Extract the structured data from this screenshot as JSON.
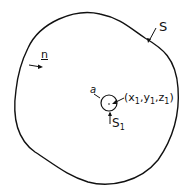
{
  "diagram": {
    "surface_label": "S",
    "normal_label": "n",
    "small_sphere_label": "S",
    "small_sphere_sub": "1",
    "radius_label": "a",
    "point_label": {
      "open": "(",
      "x": "x",
      "x_sub": "1",
      "sep1": ",",
      "y": "y",
      "y_sub": "1",
      "sep2": ",",
      "z": "z",
      "z_sub": "1",
      "close": ")"
    },
    "colors": {
      "stroke": "#111111",
      "background": "#ffffff"
    }
  }
}
